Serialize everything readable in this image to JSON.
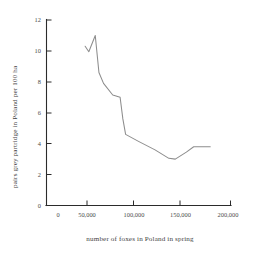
{
  "chart_data": {
    "type": "line",
    "title": "",
    "subtitle": "",
    "xlabel": "number of foxes in Poland in spring",
    "ylabel": "pairs grey partridge in Poland per 100 ha",
    "xlim": [
      0,
      200000
    ],
    "ylim": [
      0,
      12
    ],
    "grid": false,
    "legend": null,
    "xticks": [
      0,
      50000,
      100000,
      150000,
      200000
    ],
    "xtick_labels": [
      "0",
      "50,000",
      "100,000",
      "150,000",
      "200,000"
    ],
    "yticks": [
      0,
      2,
      4,
      6,
      8,
      10,
      12
    ],
    "ytick_labels": [
      "0",
      "2",
      "4",
      "6",
      "8",
      "10",
      "12"
    ],
    "series": [
      {
        "name": "grey partridge vs foxes",
        "color": "#8d8d8d",
        "x": [
          42000,
          46000,
          53000,
          57000,
          62000,
          72000,
          80000,
          83000,
          86000,
          100000,
          118000,
          133000,
          140000,
          152000,
          160000,
          178000
        ],
        "y": [
          10.3,
          9.95,
          11.0,
          8.6,
          7.9,
          7.15,
          7.0,
          5.6,
          4.6,
          4.15,
          3.6,
          3.05,
          3.0,
          3.45,
          3.8,
          3.8
        ]
      }
    ]
  },
  "axis": {
    "y_title": "pairs grey partridge in Poland per 100 ha",
    "x_title": "number of foxes in Poland in spring"
  }
}
